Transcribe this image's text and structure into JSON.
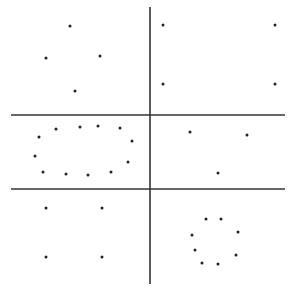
{
  "diagram": {
    "colors": {
      "background": "#ffffff",
      "line": "#333333",
      "dot": "#222222"
    },
    "lines": [
      {
        "name": "vertical-axis",
        "x1": 150,
        "y1": 7,
        "x2": 150,
        "y2": 284
      },
      {
        "name": "upper-horizontal-line",
        "x1": 11,
        "y1": 115,
        "x2": 285,
        "y2": 115
      },
      {
        "name": "lower-horizontal-line",
        "x1": 11,
        "y1": 189,
        "x2": 285,
        "y2": 189
      }
    ],
    "groups": [
      {
        "name": "top-left-diamond",
        "dots": [
          [
            70,
            26
          ],
          [
            46,
            58
          ],
          [
            100,
            56
          ],
          [
            75,
            91
          ]
        ]
      },
      {
        "name": "top-right-square",
        "dots": [
          [
            163,
            25
          ],
          [
            275,
            25
          ],
          [
            163,
            84
          ],
          [
            275,
            84
          ]
        ]
      },
      {
        "name": "middle-left-ellipse",
        "dots": [
          [
            39,
            137
          ],
          [
            56,
            129
          ],
          [
            80,
            127
          ],
          [
            98,
            126
          ],
          [
            120,
            128
          ],
          [
            132,
            141
          ],
          [
            35,
            156
          ],
          [
            43,
            172
          ],
          [
            66,
            174
          ],
          [
            88,
            175
          ],
          [
            111,
            172
          ],
          [
            128,
            162
          ]
        ]
      },
      {
        "name": "middle-right-triangle",
        "dots": [
          [
            190,
            132
          ],
          [
            247,
            135
          ],
          [
            218,
            173
          ]
        ]
      },
      {
        "name": "bottom-left-square",
        "dots": [
          [
            46,
            208
          ],
          [
            102,
            208
          ],
          [
            46,
            257
          ],
          [
            102,
            257
          ]
        ]
      },
      {
        "name": "bottom-right-circle",
        "dots": [
          [
            206,
            219
          ],
          [
            221,
            219
          ],
          [
            192,
            235
          ],
          [
            238,
            232
          ],
          [
            195,
            250
          ],
          [
            236,
            255
          ],
          [
            202,
            263
          ],
          [
            218,
            264
          ]
        ]
      }
    ],
    "dot_radius": 1.5
  }
}
